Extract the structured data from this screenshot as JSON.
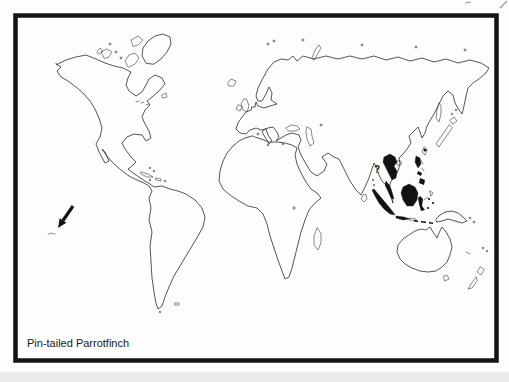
{
  "figure": {
    "caption": "Pin-tailed Parrotfinch",
    "annotations": {
      "uncertain_range_mark": "?"
    },
    "colors": {
      "ink": "#2b2b2b",
      "range_fill": "#121212",
      "frame": "#141414",
      "paper": "#fdfdfd"
    },
    "map": {
      "type": "species-distribution-world-map",
      "range_regions": [
        "Indochina-Thailand",
        "Malay Peninsula",
        "Sumatra",
        "Borneo",
        "Western Java",
        "Philippines",
        "Taiwan",
        "Sulawesi",
        "Lesser Sunda Islands"
      ],
      "pointer_arrow_present": true
    }
  }
}
